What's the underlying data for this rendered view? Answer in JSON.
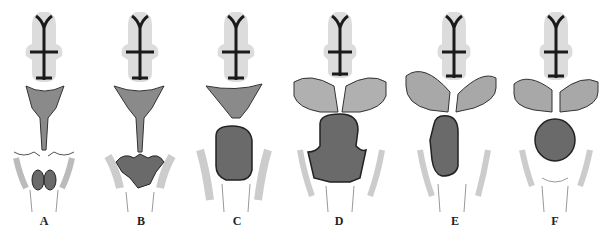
{
  "figure": {
    "panels": [
      {
        "id": "A",
        "label": "A",
        "cx": 44,
        "stage": "small-tumor-intrasellar"
      },
      {
        "id": "B",
        "label": "B",
        "cx": 141,
        "stage": "lobulated-tumor-sellar"
      },
      {
        "id": "C",
        "label": "C",
        "cx": 237,
        "stage": "enlarged-tumor-suprasellar"
      },
      {
        "id": "D",
        "label": "D",
        "cx": 339,
        "stage": "large-tumor-hydrocephalus"
      },
      {
        "id": "E",
        "label": "E",
        "cx": 455,
        "stage": "lateral-extension-hydrocephalus"
      },
      {
        "id": "F",
        "label": "F",
        "cx": 555,
        "stage": "round-suprasellar-hydrocephalus"
      }
    ],
    "colors": {
      "background": "#ffffff",
      "ventricle": "#1a1a1a",
      "brain_tissue": "#d8d8d8",
      "tumor": "#6a6a6a",
      "bone": "#eeeeee",
      "label": "#222222"
    }
  }
}
